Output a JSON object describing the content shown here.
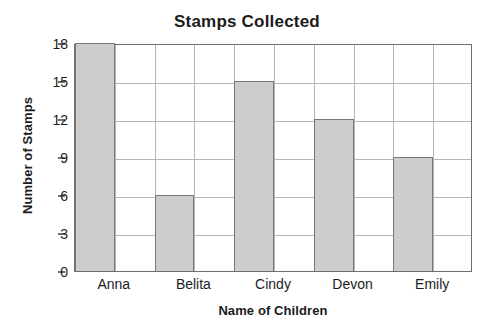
{
  "chart_data": {
    "type": "bar",
    "title": "Stamps Collected",
    "xlabel": "Name of Children",
    "ylabel": "Number of Stamps",
    "categories": [
      "Anna",
      "Belita",
      "Cindy",
      "Devon",
      "Emily"
    ],
    "values": [
      18,
      6,
      15,
      12,
      9
    ],
    "series": [
      {
        "name": "Number of Stamps",
        "values": [
          18,
          6,
          15,
          12,
          9
        ]
      }
    ],
    "ylim": [
      0,
      18
    ],
    "yticks": [
      0,
      3,
      6,
      9,
      12,
      15,
      18
    ],
    "ytick_labels": [
      "0",
      "3",
      "6",
      "9",
      "12",
      "15",
      "18"
    ],
    "ytick_step": 3,
    "grid": true,
    "grid_horizontal": true,
    "grid_vertical": true,
    "grid_columns": 10,
    "legend": false,
    "legend_position": "none",
    "bar_fill_color": "#cdcdcd",
    "bar_edge_color": "#787878",
    "grid_color": "#b6b6b6",
    "frame_color": "#6e6e6e",
    "background_color": "#ffffff",
    "text_color": "#1c1c1c"
  }
}
